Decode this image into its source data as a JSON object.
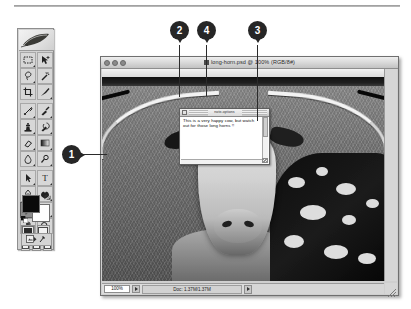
{
  "figure": {
    "application": "Adobe Photoshop",
    "platform_window_controls": [
      "close",
      "minimize",
      "zoom"
    ]
  },
  "toolbox": {
    "name": "Photoshop Toolbox",
    "logo_icon": "feather-logo-icon",
    "tools": [
      {
        "row": 1,
        "items": [
          {
            "name": "marquee-tool",
            "icon": "marquee-icon",
            "selected": false
          },
          {
            "name": "move-tool",
            "icon": "move-arrow-icon",
            "selected": false
          }
        ]
      },
      {
        "row": 2,
        "items": [
          {
            "name": "lasso-tool",
            "icon": "lasso-icon",
            "selected": false
          },
          {
            "name": "magic-wand-tool",
            "icon": "magic-wand-icon",
            "selected": false
          }
        ]
      },
      {
        "row": 3,
        "items": [
          {
            "name": "crop-tool",
            "icon": "crop-icon",
            "selected": false
          },
          {
            "name": "slice-tool",
            "icon": "slice-knife-icon",
            "selected": false
          }
        ]
      },
      {
        "row": 4,
        "items": [
          {
            "name": "healing-brush-tool",
            "icon": "healing-brush-icon",
            "selected": false
          },
          {
            "name": "paintbrush-tool",
            "icon": "paintbrush-icon",
            "selected": false
          }
        ]
      },
      {
        "row": 5,
        "items": [
          {
            "name": "clone-stamp-tool",
            "icon": "clone-stamp-icon",
            "selected": false
          },
          {
            "name": "history-brush-tool",
            "icon": "history-brush-icon",
            "selected": false
          }
        ]
      },
      {
        "row": 6,
        "items": [
          {
            "name": "eraser-tool",
            "icon": "eraser-icon",
            "selected": false
          },
          {
            "name": "gradient-tool",
            "icon": "gradient-icon",
            "selected": false
          }
        ]
      },
      {
        "row": 7,
        "items": [
          {
            "name": "blur-tool",
            "icon": "waterdrop-icon",
            "selected": false
          },
          {
            "name": "dodge-tool",
            "icon": "dodge-burn-icon",
            "selected": false
          }
        ]
      },
      {
        "row": 8,
        "items": [
          {
            "name": "path-selection-tool",
            "icon": "black-arrow-icon",
            "selected": false
          },
          {
            "name": "type-tool",
            "icon": "type-T-icon",
            "selected": false,
            "label": "T"
          }
        ]
      },
      {
        "row": 9,
        "items": [
          {
            "name": "pen-tool",
            "icon": "pen-nib-icon",
            "selected": false
          },
          {
            "name": "shape-tool",
            "icon": "custom-shape-icon",
            "selected": false
          }
        ]
      },
      {
        "row": 10,
        "items": [
          {
            "name": "notes-tool",
            "icon": "notes-annotation-icon",
            "selected": true
          },
          {
            "name": "eyedropper-tool",
            "icon": "eyedropper-icon",
            "selected": false
          }
        ]
      },
      {
        "row": 11,
        "items": [
          {
            "name": "hand-tool",
            "icon": "hand-icon",
            "selected": false
          },
          {
            "name": "zoom-tool",
            "icon": "magnifier-icon",
            "selected": false
          }
        ]
      }
    ],
    "colors": {
      "foreground": "#0a0a0a",
      "background": "#fdfdfd",
      "swap_icon": "swap-colors-icon",
      "default_icon": "default-colors-icon"
    },
    "mask_modes": [
      {
        "name": "standard-mode-button",
        "icon": "standard-mask-icon"
      },
      {
        "name": "quick-mask-mode-button",
        "icon": "quick-mask-icon"
      }
    ],
    "screen_modes": [
      {
        "name": "standard-screen-mode-button",
        "icon": "standard-screen-icon"
      },
      {
        "name": "full-screen-with-menubar-button",
        "icon": "fullscreen-menubar-icon"
      },
      {
        "name": "full-screen-mode-button",
        "icon": "fullscreen-icon"
      }
    ],
    "jump_to": {
      "name": "jump-to-imageready-button",
      "icon": "imageready-icon"
    }
  },
  "document_window": {
    "title": "long-horn.psd @ 100% (RGB/8#)",
    "title_icon": "document-proxy-icon",
    "status_bar": {
      "zoom_value": "100%",
      "zoom_popup_icon": "triangle-right-icon",
      "doc_info": "Doc: 1.37M/1.37M",
      "info_popup_icon": "triangle-right-icon"
    },
    "scrollbars": {
      "vertical": "vertical-scrollbar",
      "horizontal": "horizontal-scrollbar"
    },
    "image_subject": "black and white longhorn cow in a field"
  },
  "note_window": {
    "title": "note-options",
    "close_icon": "note-close-box-icon",
    "text": "This is a very happy cow, but watch out for those long horns !!",
    "scrollbar_icon": "note-vertical-scrollbar",
    "resize_grip_icon": "resize-grip-icon"
  },
  "callouts": [
    {
      "number": "1",
      "target": "notes-tool in toolbox",
      "pointer": "right"
    },
    {
      "number": "2",
      "target": "note window close box",
      "pointer": "down"
    },
    {
      "number": "4",
      "target": "note window title bar",
      "pointer": "down"
    },
    {
      "number": "3",
      "target": "note window scroll area",
      "pointer": "down"
    }
  ],
  "colors": {
    "callout_fill": "#262626",
    "callout_text": "#ffffff",
    "toolbox_bg": "#d2d2d2",
    "window_chrome": "#cfcfcf"
  }
}
